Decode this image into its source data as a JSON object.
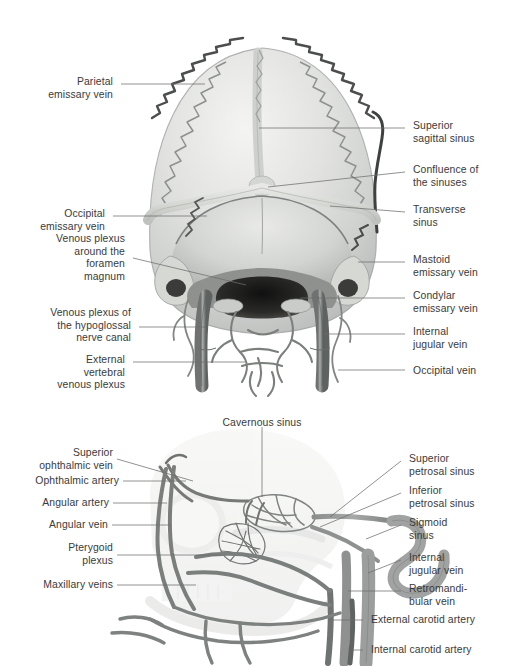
{
  "page": {
    "background_color": "#ffffff",
    "text_color": "#3a3a3a",
    "leader_line_color": "#6e6e6e",
    "illustration_style": "grayscale anatomical atlas halftone"
  },
  "figures": [
    {
      "id": "cranial-posterior",
      "view": "Posterior view of the skull showing dural venous sinuses, emissary veins and the external vertebral venous plexus",
      "labels_left": [
        {
          "id": "parietal-emissary-vein",
          "text": "Parietal\nemissary vein"
        },
        {
          "id": "occipital-emissary-vein",
          "text": "Occipital\nemissary vein"
        },
        {
          "id": "venous-plexus-foramen-magnum",
          "text": "Venous plexus\naround the\nforamen\nmagnum"
        },
        {
          "id": "venous-plexus-hypoglossal-canal",
          "text": "Venous plexus of\nthe hypoglossal\nnerve canal"
        },
        {
          "id": "external-vertebral-venous-plexus",
          "text": "External\nvertebral\nvenous plexus"
        }
      ],
      "labels_right": [
        {
          "id": "superior-sagittal-sinus",
          "text": "Superior\nsagittal sinus"
        },
        {
          "id": "confluence-of-the-sinuses",
          "text": "Confluence of\nthe sinuses"
        },
        {
          "id": "transverse-sinus",
          "text": "Transverse\nsinus"
        },
        {
          "id": "mastoid-emissary-vein",
          "text": "Mastoid\nemissary vein"
        },
        {
          "id": "condylar-emissary-vein",
          "text": "Condylar\nemissary vein"
        },
        {
          "id": "internal-jugular-vein",
          "text": "Internal\njugular vein"
        },
        {
          "id": "occipital-vein",
          "text": "Occipital vein"
        }
      ]
    },
    {
      "id": "skull-lateral",
      "view": "Left lateral view of the skull showing the cavernous sinus, pterygoid plexus and carotid vessels",
      "labels_top": [
        {
          "id": "cavernous-sinus",
          "text": "Cavernous sinus"
        }
      ],
      "labels_left": [
        {
          "id": "superior-ophthalmic-vein",
          "text": "Superior\nophthalmic vein"
        },
        {
          "id": "ophthalmic-artery",
          "text": "Ophthalmic artery"
        },
        {
          "id": "angular-artery",
          "text": "Angular artery"
        },
        {
          "id": "angular-vein",
          "text": "Angular vein"
        },
        {
          "id": "pterygoid-plexus",
          "text": "Pterygoid\nplexus"
        },
        {
          "id": "maxillary-veins",
          "text": "Maxillary veins"
        }
      ],
      "labels_right": [
        {
          "id": "superior-petrosal-sinus",
          "text": "Superior\npetrosal sinus"
        },
        {
          "id": "inferior-petrosal-sinus",
          "text": "Inferior\npetrosal sinus"
        },
        {
          "id": "sigmoid-sinus",
          "text": "Sigmoid\nsinus"
        },
        {
          "id": "internal-jugular-vein-lateral",
          "text": "Internal\njugular vein"
        },
        {
          "id": "retromandibular-vein",
          "text": "Retromandi-\nbular vein"
        },
        {
          "id": "external-carotid-artery",
          "text": "External carotid artery"
        },
        {
          "id": "internal-carotid-artery",
          "text": "Internal carotid artery"
        }
      ]
    }
  ]
}
